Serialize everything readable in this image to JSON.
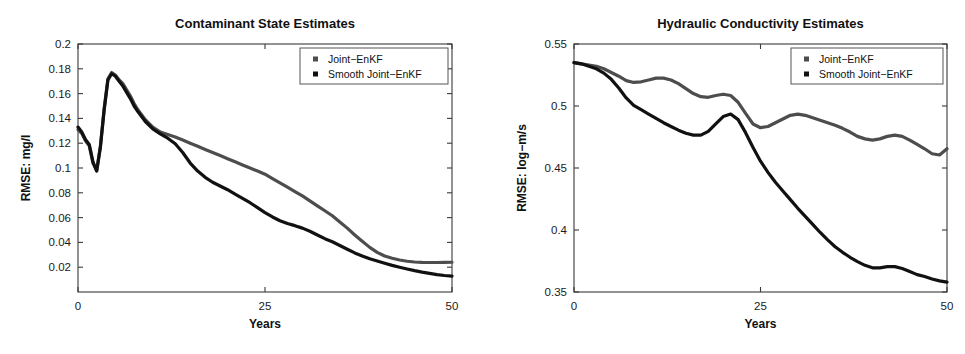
{
  "figure": {
    "background": "#ffffff",
    "panel_count": 2
  },
  "colors": {
    "series_joint": "#4d4d4d",
    "series_smooth": "#111111",
    "axis": "#3a3a3a",
    "text": "#111111",
    "legend_border": "#555555"
  },
  "legend": {
    "entries": [
      {
        "label": "Joint−EnKF",
        "marker": "square-marker",
        "color": "#4d4d4d"
      },
      {
        "label": "Smooth Joint−EnKF",
        "marker": "square-marker",
        "color": "#111111"
      }
    ]
  },
  "chart_data": [
    {
      "type": "line",
      "id": "contaminant-state-estimates",
      "title": "Contaminant State Estimates",
      "xlabel": "Years",
      "ylabel": "RMSE: mg/l",
      "xlim": [
        0,
        50
      ],
      "ylim": [
        0,
        0.2
      ],
      "xticks": [
        0,
        25,
        50
      ],
      "xtick_labels": [
        "0",
        "25",
        "50"
      ],
      "yticks": [
        0.02,
        0.04,
        0.06,
        0.08,
        0.1,
        0.12,
        0.14,
        0.16,
        0.18,
        0.2
      ],
      "ytick_labels": [
        "0.02",
        "0.04",
        "0.06",
        "0.08",
        "0.1",
        "0.12",
        "0.14",
        "0.16",
        "0.18",
        "0.2"
      ],
      "grid": false,
      "legend_position": "top-right",
      "x": [
        0,
        0.5,
        1,
        1.5,
        2,
        2.5,
        3,
        3.5,
        4,
        4.5,
        5,
        5.5,
        6,
        6.5,
        7,
        7.5,
        8,
        9,
        10,
        11,
        12,
        13,
        14,
        15,
        16,
        17,
        18,
        19,
        20,
        21,
        22,
        23,
        24,
        25,
        26,
        27,
        28,
        29,
        30,
        31,
        32,
        33,
        34,
        35,
        36,
        37,
        38,
        39,
        40,
        41,
        42,
        43,
        44,
        45,
        46,
        47,
        48,
        49,
        50
      ],
      "series": [
        {
          "name": "Joint−EnKF",
          "color": "#4d4d4d",
          "values": [
            0.131,
            0.128,
            0.122,
            0.118,
            0.104,
            0.098,
            0.118,
            0.148,
            0.172,
            0.177,
            0.175,
            0.171,
            0.168,
            0.163,
            0.158,
            0.152,
            0.147,
            0.139,
            0.133,
            0.129,
            0.127,
            0.125,
            0.1225,
            0.12,
            0.1175,
            0.115,
            0.1125,
            0.11,
            0.1075,
            0.105,
            0.1025,
            0.1,
            0.0975,
            0.095,
            0.0915,
            0.088,
            0.0845,
            0.081,
            0.0775,
            0.0735,
            0.0695,
            0.0655,
            0.0615,
            0.0565,
            0.0515,
            0.046,
            0.041,
            0.036,
            0.032,
            0.029,
            0.0272,
            0.0258,
            0.0248,
            0.0242,
            0.0239,
            0.0238,
            0.0238,
            0.0239,
            0.024
          ]
        },
        {
          "name": "Smooth Joint−EnKF",
          "color": "#111111",
          "values": [
            0.133,
            0.129,
            0.123,
            0.119,
            0.105,
            0.0975,
            0.117,
            0.147,
            0.171,
            0.176,
            0.174,
            0.17,
            0.166,
            0.161,
            0.156,
            0.15,
            0.1455,
            0.1375,
            0.1315,
            0.1275,
            0.124,
            0.1195,
            0.1125,
            0.104,
            0.0975,
            0.0925,
            0.0885,
            0.0855,
            0.0825,
            0.079,
            0.0755,
            0.072,
            0.068,
            0.064,
            0.0605,
            0.0575,
            0.0552,
            0.0535,
            0.0515,
            0.049,
            0.046,
            0.043,
            0.0405,
            0.0375,
            0.0345,
            0.0315,
            0.029,
            0.0268,
            0.025,
            0.0232,
            0.0215,
            0.02,
            0.0186,
            0.0172,
            0.016,
            0.015,
            0.014,
            0.0133,
            0.0128
          ]
        }
      ]
    },
    {
      "type": "line",
      "id": "hydraulic-conductivity-estimates",
      "title": "Hydraulic Conductivity Estimates",
      "xlabel": "Years",
      "ylabel": "RMSE: log−m/s",
      "xlim": [
        0,
        50
      ],
      "ylim": [
        0.35,
        0.55
      ],
      "xticks": [
        0,
        25,
        50
      ],
      "xtick_labels": [
        "0",
        "25",
        "50"
      ],
      "yticks": [
        0.35,
        0.4,
        0.45,
        0.5,
        0.55
      ],
      "ytick_labels": [
        "0.35",
        "0.4",
        "0.45",
        "0.5",
        "0.55"
      ],
      "grid": false,
      "legend_position": "top-right",
      "x": [
        0,
        1,
        2,
        3,
        4,
        5,
        6,
        7,
        8,
        9,
        10,
        11,
        12,
        13,
        14,
        15,
        16,
        17,
        18,
        19,
        20,
        21,
        22,
        23,
        24,
        25,
        26,
        27,
        28,
        29,
        30,
        31,
        32,
        33,
        34,
        35,
        36,
        37,
        38,
        39,
        40,
        41,
        42,
        43,
        44,
        45,
        46,
        47,
        48,
        49,
        50
      ],
      "series": [
        {
          "name": "Joint−EnKF",
          "color": "#4d4d4d",
          "values": [
            0.535,
            0.534,
            0.533,
            0.532,
            0.53,
            0.527,
            0.524,
            0.5205,
            0.519,
            0.5195,
            0.521,
            0.5225,
            0.5225,
            0.521,
            0.518,
            0.514,
            0.51,
            0.5075,
            0.507,
            0.5085,
            0.5095,
            0.5085,
            0.503,
            0.494,
            0.4855,
            0.4825,
            0.4835,
            0.4865,
            0.4895,
            0.4925,
            0.4935,
            0.4925,
            0.4905,
            0.4885,
            0.4865,
            0.4845,
            0.482,
            0.479,
            0.4755,
            0.4735,
            0.4725,
            0.4735,
            0.4755,
            0.4765,
            0.4755,
            0.4725,
            0.469,
            0.4655,
            0.4615,
            0.4605,
            0.4655
          ]
        },
        {
          "name": "Smooth Joint−EnKF",
          "color": "#111111",
          "values": [
            0.535,
            0.534,
            0.532,
            0.53,
            0.5265,
            0.5215,
            0.5145,
            0.5065,
            0.5005,
            0.497,
            0.4935,
            0.49,
            0.4865,
            0.4835,
            0.4805,
            0.478,
            0.4765,
            0.4765,
            0.4795,
            0.4855,
            0.4915,
            0.4935,
            0.489,
            0.4785,
            0.4665,
            0.4555,
            0.4465,
            0.4385,
            0.4315,
            0.4245,
            0.4175,
            0.411,
            0.4045,
            0.398,
            0.392,
            0.3865,
            0.382,
            0.378,
            0.3745,
            0.3715,
            0.3695,
            0.3695,
            0.3705,
            0.3705,
            0.369,
            0.3665,
            0.364,
            0.3625,
            0.3605,
            0.359,
            0.358
          ]
        }
      ]
    }
  ]
}
